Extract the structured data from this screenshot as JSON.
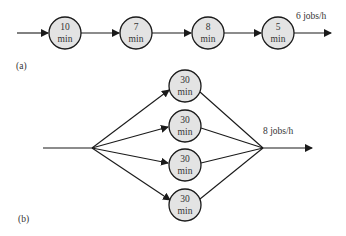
{
  "diagram": {
    "part_a": {
      "label": "(a)",
      "throughput_label": "6 jobs/h",
      "stations": [
        {
          "line1": "10",
          "line2": "min"
        },
        {
          "line1": "7",
          "line2": "min"
        },
        {
          "line1": "8",
          "line2": "min"
        },
        {
          "line1": "5",
          "line2": "min"
        }
      ]
    },
    "part_b": {
      "label": "(b)",
      "throughput_label": "8 jobs/h",
      "stations": [
        {
          "line1": "30",
          "line2": "min"
        },
        {
          "line1": "30",
          "line2": "min"
        },
        {
          "line1": "30",
          "line2": "min"
        },
        {
          "line1": "30",
          "line2": "min"
        }
      ]
    },
    "colors": {
      "node_fill": "#e3e3e3",
      "stroke": "#1a1a1a",
      "text": "#333333"
    }
  }
}
